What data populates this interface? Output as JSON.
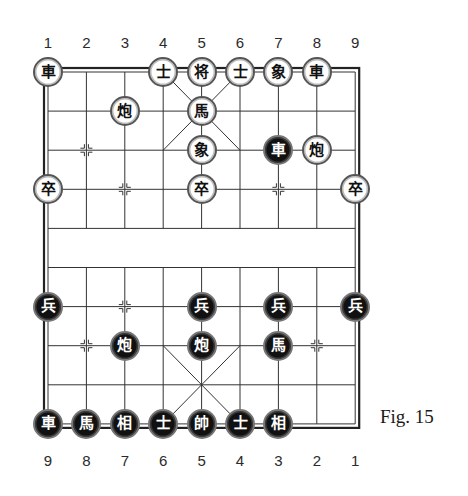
{
  "figure": {
    "caption": "Fig. 15"
  },
  "board": {
    "files": 9,
    "ranks": 10,
    "top_file_labels": [
      "1",
      "2",
      "3",
      "4",
      "5",
      "6",
      "7",
      "8",
      "9"
    ],
    "bottom_file_labels": [
      "9",
      "8",
      "7",
      "6",
      "5",
      "4",
      "3",
      "2",
      "1"
    ],
    "colors": {
      "line": "#333333",
      "border": "#222222",
      "background": "#ffffff"
    }
  },
  "pieces": {
    "top_side_outline": [
      {
        "char": "車",
        "name": "chariot",
        "col": 0,
        "row": 0
      },
      {
        "char": "士",
        "name": "advisor",
        "col": 3,
        "row": 0
      },
      {
        "char": "将",
        "name": "general",
        "col": 4,
        "row": 0
      },
      {
        "char": "士",
        "name": "advisor",
        "col": 5,
        "row": 0
      },
      {
        "char": "象",
        "name": "elephant",
        "col": 6,
        "row": 0
      },
      {
        "char": "車",
        "name": "chariot",
        "col": 7,
        "row": 0
      },
      {
        "char": "炮",
        "name": "cannon",
        "col": 2,
        "row": 1
      },
      {
        "char": "馬",
        "name": "horse",
        "col": 4,
        "row": 1
      },
      {
        "char": "象",
        "name": "elephant",
        "col": 4,
        "row": 2
      },
      {
        "char": "炮",
        "name": "cannon",
        "col": 7,
        "row": 2
      },
      {
        "char": "卒",
        "name": "soldier",
        "col": 0,
        "row": 3
      },
      {
        "char": "卒",
        "name": "soldier",
        "col": 4,
        "row": 3
      },
      {
        "char": "卒",
        "name": "soldier",
        "col": 8,
        "row": 3
      }
    ],
    "bottom_side_solid": [
      {
        "char": "車",
        "name": "chariot",
        "col": 6,
        "row": 2
      },
      {
        "char": "兵",
        "name": "soldier",
        "col": 0,
        "row": 6
      },
      {
        "char": "兵",
        "name": "soldier",
        "col": 4,
        "row": 6
      },
      {
        "char": "兵",
        "name": "soldier",
        "col": 6,
        "row": 6
      },
      {
        "char": "兵",
        "name": "soldier",
        "col": 8,
        "row": 6
      },
      {
        "char": "炮",
        "name": "cannon",
        "col": 2,
        "row": 7
      },
      {
        "char": "炮",
        "name": "cannon",
        "col": 4,
        "row": 7
      },
      {
        "char": "馬",
        "name": "horse",
        "col": 6,
        "row": 7
      },
      {
        "char": "車",
        "name": "chariot",
        "col": 0,
        "row": 9
      },
      {
        "char": "馬",
        "name": "horse",
        "col": 1,
        "row": 9
      },
      {
        "char": "相",
        "name": "elephant",
        "col": 2,
        "row": 9
      },
      {
        "char": "士",
        "name": "advisor",
        "col": 3,
        "row": 9
      },
      {
        "char": "帥",
        "name": "general",
        "col": 4,
        "row": 9
      },
      {
        "char": "士",
        "name": "advisor",
        "col": 5,
        "row": 9
      },
      {
        "char": "相",
        "name": "elephant",
        "col": 6,
        "row": 9
      }
    ]
  }
}
